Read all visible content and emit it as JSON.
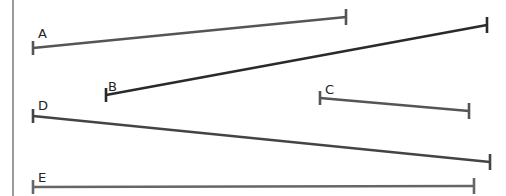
{
  "diagram": {
    "border": {
      "x": 13,
      "color": "#9a9a9a"
    },
    "segments": [
      {
        "id": "A",
        "label": "A",
        "x1": 33,
        "y1": 48,
        "x2": 346,
        "y2": 17,
        "color": "#555555",
        "label_x": 38,
        "label_y": 38
      },
      {
        "id": "B",
        "label": "B",
        "x1": 106,
        "y1": 95,
        "x2": 487,
        "y2": 25,
        "color": "#2a2a2a",
        "label_x": 108,
        "label_y": 91
      },
      {
        "id": "C",
        "label": "C",
        "x1": 320,
        "y1": 98,
        "x2": 469,
        "y2": 111,
        "color": "#555555",
        "label_x": 325,
        "label_y": 94
      },
      {
        "id": "D",
        "label": "D",
        "x1": 33,
        "y1": 116,
        "x2": 490,
        "y2": 162,
        "color": "#444444",
        "label_x": 38,
        "label_y": 110
      },
      {
        "id": "E",
        "label": "E",
        "x1": 33,
        "y1": 187,
        "x2": 474,
        "y2": 186,
        "color": "#666666",
        "label_x": 38,
        "label_y": 182
      }
    ]
  }
}
